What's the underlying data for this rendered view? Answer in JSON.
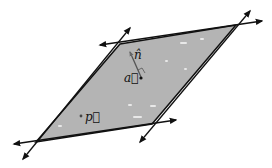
{
  "diagram": {
    "plane_fill": "#b4b4b4",
    "edge_color": "#111111",
    "corners": {
      "top_left": [
        120,
        44
      ],
      "top_right": [
        236,
        25
      ],
      "bottom_right": [
        152,
        124
      ],
      "bottom_left": [
        36,
        142
      ]
    },
    "labels": {
      "normal": "n̂",
      "point_a": "a⃗",
      "point_p": "p⃗"
    },
    "points": {
      "a": [
        141,
        78
      ],
      "p": [
        81,
        116
      ],
      "n_tip": [
        129,
        51
      ]
    }
  }
}
